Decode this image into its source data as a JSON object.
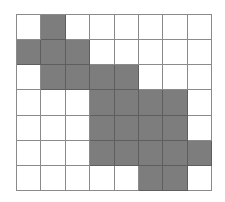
{
  "grid": {
    "rows": 7,
    "cols": 8,
    "fill_color": "#7d7d7d",
    "empty_color": "#ffffff",
    "line_color": "#8a8a8a",
    "cells": [
      [
        0,
        1,
        0,
        0,
        0,
        0,
        0,
        0
      ],
      [
        1,
        1,
        1,
        0,
        0,
        0,
        0,
        0
      ],
      [
        0,
        1,
        1,
        1,
        1,
        0,
        0,
        0
      ],
      [
        0,
        0,
        0,
        1,
        1,
        1,
        1,
        0
      ],
      [
        0,
        0,
        0,
        1,
        1,
        1,
        1,
        0
      ],
      [
        0,
        0,
        0,
        1,
        1,
        1,
        1,
        1
      ],
      [
        0,
        0,
        0,
        0,
        0,
        1,
        1,
        0
      ]
    ]
  }
}
